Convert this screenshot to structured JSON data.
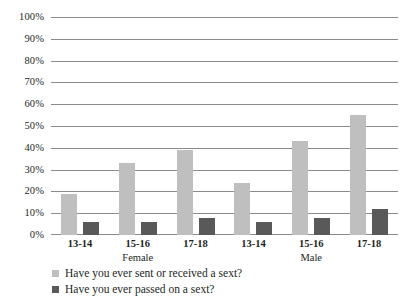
{
  "chart_data": {
    "type": "bar",
    "title": "",
    "subtitle": "",
    "xlabel": "",
    "ylabel": "",
    "ylim": [
      0,
      100
    ],
    "y_unit": "%",
    "grid": true,
    "legend_position": "bottom-left",
    "orientation": "vertical",
    "categories": [
      "13-14",
      "15-16",
      "17-18",
      "13-14",
      "15-16",
      "17-18"
    ],
    "groups": [
      {
        "label": "Female",
        "categories": [
          "13-14",
          "15-16",
          "17-18"
        ]
      },
      {
        "label": "Male",
        "categories": [
          "13-14",
          "15-16",
          "17-18"
        ]
      }
    ],
    "series": [
      {
        "name": "Have you ever sent or received a sext?",
        "color": "#bfbfbf",
        "values": [
          19,
          33,
          39,
          24,
          43,
          55
        ]
      },
      {
        "name": "Have you ever passed on a sext?",
        "color": "#595959",
        "values": [
          6,
          6,
          8,
          6,
          8,
          12
        ]
      }
    ],
    "yticks": [
      {
        "value": 100,
        "label": "100%"
      },
      {
        "value": 90,
        "label": "90%"
      },
      {
        "value": 80,
        "label": "80%"
      },
      {
        "value": 70,
        "label": "70%"
      },
      {
        "value": 60,
        "label": "60%"
      },
      {
        "value": 50,
        "label": "50%"
      },
      {
        "value": 40,
        "label": "40%"
      },
      {
        "value": 30,
        "label": "30%"
      },
      {
        "value": 20,
        "label": "20%"
      },
      {
        "value": 10,
        "label": "10%"
      },
      {
        "value": 0,
        "label": "0%"
      }
    ]
  },
  "legend": {
    "items": [
      {
        "label": "Have you ever sent or received a sext?",
        "color": "#bfbfbf"
      },
      {
        "label": "Have you ever passed on a sext?",
        "color": "#595959"
      }
    ]
  },
  "colors": {
    "series_light": "#bfbfbf",
    "series_dark": "#595959",
    "gridline": "#8b8b8b",
    "text": "#231f1d",
    "background": "#ffffff"
  }
}
